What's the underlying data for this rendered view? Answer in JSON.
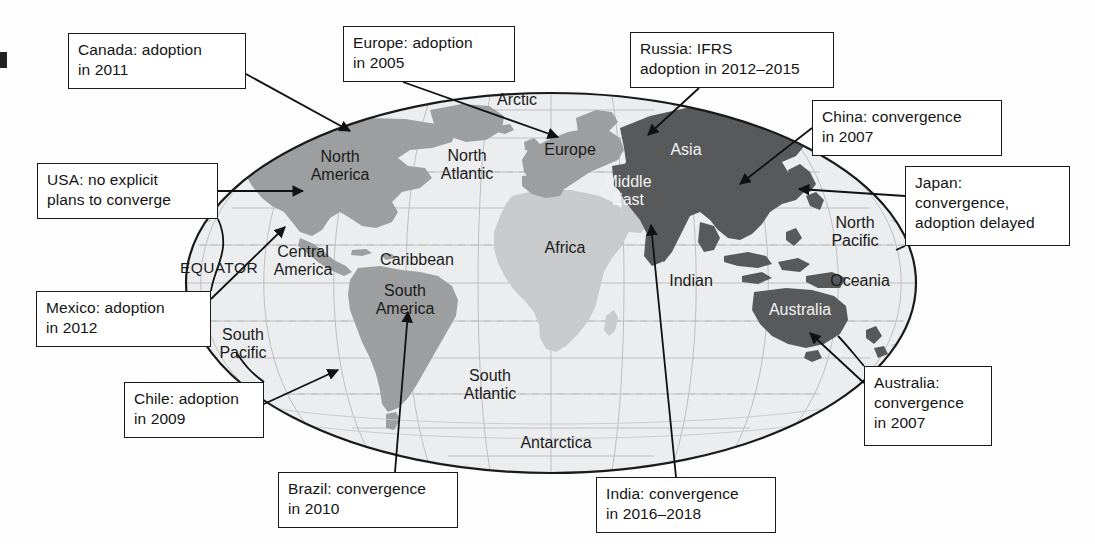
{
  "diagram": {
    "type": "world-map-annotated",
    "projection": "oval / elliptical world projection",
    "binding_mark": {
      "name": "page-binding-mark"
    }
  },
  "legend_shading": {
    "dark_gray": "#58595b",
    "medium_gray": "#9d9e9f",
    "light_gray": "#c9cacb",
    "ocean": "#eceded",
    "graticule": "#b9bcbe",
    "outline": "#1a1a1a"
  },
  "callouts": [
    {
      "id": "canada",
      "name": "callout-canada",
      "text": "Canada: adoption\nin 2011",
      "x": 68,
      "y": 33,
      "w": 178,
      "h": 56
    },
    {
      "id": "europe",
      "name": "callout-europe",
      "text": "Europe: adoption\nin 2005",
      "x": 343,
      "y": 26,
      "w": 172,
      "h": 56
    },
    {
      "id": "russia",
      "name": "callout-russia",
      "text": "Russia: IFRS\nadoption in 2012–2015",
      "x": 630,
      "y": 32,
      "w": 204,
      "h": 56
    },
    {
      "id": "china",
      "name": "callout-china",
      "text": "China: convergence\nin 2007",
      "x": 812,
      "y": 100,
      "w": 190,
      "h": 56
    },
    {
      "id": "usa",
      "name": "callout-usa",
      "text": "USA: no explicit\nplans to converge",
      "x": 37,
      "y": 163,
      "w": 181,
      "h": 56
    },
    {
      "id": "japan",
      "name": "callout-japan",
      "text": "Japan:\nconvergence,\nadoption delayed",
      "x": 905,
      "y": 166,
      "w": 165,
      "h": 80
    },
    {
      "id": "mexico",
      "name": "callout-mexico",
      "text": "Mexico: adoption\nin 2012",
      "x": 36,
      "y": 291,
      "w": 175,
      "h": 56
    },
    {
      "id": "chile",
      "name": "callout-chile",
      "text": "Chile: adoption\nin 2009",
      "x": 124,
      "y": 382,
      "w": 140,
      "h": 56
    },
    {
      "id": "australia",
      "name": "callout-australia",
      "text": "Australia:\nconvergence\nin 2007",
      "x": 864,
      "y": 366,
      "w": 128,
      "h": 80
    },
    {
      "id": "brazil",
      "name": "callout-brazil",
      "text": "Brazil: convergence\nin 2010",
      "x": 278,
      "y": 472,
      "w": 180,
      "h": 56
    },
    {
      "id": "india",
      "name": "callout-india",
      "text": "India: convergence\nin 2016–2018",
      "x": 596,
      "y": 477,
      "w": 180,
      "h": 56
    }
  ],
  "map_labels": [
    {
      "id": "arctic",
      "name": "map-label-arctic",
      "text": "Arctic",
      "x": 517,
      "y": 100,
      "tone": "dark"
    },
    {
      "id": "north-america",
      "name": "map-label-north-america",
      "text": "North\nAmerica",
      "x": 340,
      "y": 166,
      "tone": "dark"
    },
    {
      "id": "north-atlantic",
      "name": "map-label-north-atlantic",
      "text": "North\nAtlantic",
      "x": 467,
      "y": 165,
      "tone": "dark"
    },
    {
      "id": "europe",
      "name": "map-label-europe",
      "text": "Europe",
      "x": 570,
      "y": 150,
      "tone": "dark"
    },
    {
      "id": "asia",
      "name": "map-label-asia",
      "text": "Asia",
      "x": 686,
      "y": 150,
      "tone": "light"
    },
    {
      "id": "caribbean",
      "name": "map-label-caribbean",
      "text": "Caribbean",
      "x": 417,
      "y": 260,
      "tone": "dark"
    },
    {
      "id": "middle-east",
      "name": "map-label-middle-east",
      "text": "Middle\nEast",
      "x": 628,
      "y": 191,
      "tone": "light"
    },
    {
      "id": "central-america",
      "name": "map-label-central-america",
      "text": "Central\nAmerica",
      "x": 303,
      "y": 261,
      "tone": "dark"
    },
    {
      "id": "africa",
      "name": "map-label-africa",
      "text": "Africa",
      "x": 565,
      "y": 248,
      "tone": "dark"
    },
    {
      "id": "north-pacific",
      "name": "map-label-north-pacific",
      "text": "North\nPacific",
      "x": 855,
      "y": 232,
      "tone": "dark"
    },
    {
      "id": "equator",
      "name": "map-label-equator",
      "text": "EQUATOR",
      "x": 219,
      "y": 268,
      "tone": "dark"
    },
    {
      "id": "south-america",
      "name": "map-label-south-america",
      "text": "South\nAmerica",
      "x": 405,
      "y": 300,
      "tone": "dark"
    },
    {
      "id": "indian",
      "name": "map-label-indian",
      "text": "Indian",
      "x": 691,
      "y": 281,
      "tone": "dark"
    },
    {
      "id": "oceania",
      "name": "map-label-oceania",
      "text": "Oceania",
      "x": 860,
      "y": 281,
      "tone": "dark"
    },
    {
      "id": "south-pacific",
      "name": "map-label-south-pacific",
      "text": "South\nPacific",
      "x": 243,
      "y": 344,
      "tone": "dark"
    },
    {
      "id": "australia",
      "name": "map-label-australia",
      "text": "Australia",
      "x": 800,
      "y": 310,
      "tone": "light"
    },
    {
      "id": "south-atlantic",
      "name": "map-label-south-atlantic",
      "text": "South\nAtlantic",
      "x": 490,
      "y": 385,
      "tone": "dark"
    },
    {
      "id": "antarctica",
      "name": "map-label-antarctica",
      "text": "Antarctica",
      "x": 556,
      "y": 443,
      "tone": "dark"
    }
  ],
  "leader_lines": [
    {
      "id": "canada",
      "name": "leader-canada",
      "from": [
        246,
        74
      ],
      "to": [
        350,
        131
      ],
      "arrow": true
    },
    {
      "id": "europe",
      "name": "leader-europe",
      "from": [
        403,
        82
      ],
      "to": [
        558,
        137
      ],
      "arrow": true
    },
    {
      "id": "russia",
      "name": "leader-russia",
      "from": [
        699,
        88
      ],
      "to": [
        648,
        135
      ],
      "arrow": true
    },
    {
      "id": "china",
      "name": "leader-china",
      "from": [
        812,
        128
      ],
      "to": [
        740,
        184
      ],
      "arrow": true
    },
    {
      "id": "usa",
      "name": "leader-usa",
      "from": [
        218,
        191
      ],
      "to": [
        303,
        191
      ],
      "arrow": true
    },
    {
      "id": "japan",
      "name": "leader-japan",
      "from": [
        905,
        196
      ],
      "to": [
        799,
        189
      ],
      "arrow": true
    },
    {
      "id": "mexico",
      "name": "leader-mexico",
      "from": [
        211,
        299
      ],
      "to": [
        285,
        227
      ],
      "arrow": true
    },
    {
      "id": "chile",
      "name": "leader-chile",
      "from": [
        264,
        404
      ],
      "to": [
        338,
        370
      ],
      "arrow": true
    },
    {
      "id": "australia",
      "name": "leader-australia",
      "from": [
        864,
        383
      ],
      "to": [
        810,
        333
      ],
      "arrow": true
    },
    {
      "id": "brazil",
      "name": "leader-brazil",
      "from": [
        395,
        472
      ],
      "to": [
        408,
        312
      ],
      "arrow": true
    },
    {
      "id": "india",
      "name": "leader-india",
      "from": [
        676,
        477
      ],
      "to": [
        651,
        225
      ],
      "arrow": true
    }
  ]
}
